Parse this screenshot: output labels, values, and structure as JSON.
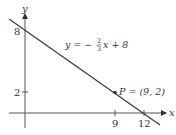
{
  "diagram": {
    "type": "coordinate-plane-line",
    "axes": {
      "x_label": "x",
      "y_label": "y",
      "x_ticks": [
        {
          "value": 9,
          "label": "9"
        },
        {
          "value": 12,
          "label": "12"
        }
      ],
      "y_ticks": [
        {
          "value": 2,
          "label": "2"
        },
        {
          "value": 8,
          "label": "8"
        }
      ]
    },
    "line": {
      "equation_lhs": "y = −",
      "fraction_num": "2",
      "fraction_den": "3",
      "equation_rhs": "x + 8",
      "slope": -0.6667,
      "intercept": 8,
      "x_intercept": 12
    },
    "point": {
      "label": "P = (9, 2)",
      "x": 9,
      "y": 2
    },
    "colors": {
      "axis": "#555555",
      "line": "#3a3a3a",
      "text": "#333333"
    }
  }
}
